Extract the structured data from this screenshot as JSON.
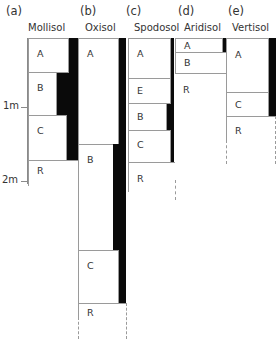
{
  "columns": [
    {
      "letter": "(a)",
      "name": "Mollisol",
      "horizons": [
        {
          "label": "A"
        },
        {
          "label": "B"
        },
        {
          "label": "C"
        },
        {
          "label": "R"
        }
      ]
    },
    {
      "letter": "(b)",
      "name": "Oxisol",
      "horizons": [
        {
          "label": "A"
        },
        {
          "label": "B"
        },
        {
          "label": "C"
        },
        {
          "label": "R"
        }
      ]
    },
    {
      "letter": "(c)",
      "name": "Spodosol",
      "horizons": [
        {
          "label": "A"
        },
        {
          "label": "E"
        },
        {
          "label": "B"
        },
        {
          "label": "C"
        },
        {
          "label": "R"
        }
      ]
    },
    {
      "letter": "(d)",
      "name": "Aridisol",
      "horizons": [
        {
          "label": "A"
        },
        {
          "label": "B"
        },
        {
          "label": "R"
        }
      ]
    },
    {
      "letter": "(e)",
      "name": "Vertisol",
      "horizons": [
        {
          "label": "A"
        },
        {
          "label": "C"
        },
        {
          "label": "R"
        }
      ]
    }
  ],
  "depth_axis": {
    "ticks": [
      {
        "label": "1m"
      },
      {
        "label": "2m"
      }
    ]
  },
  "colors": {
    "organic_bar": "#0a0a0a",
    "outline": "#9a9a9a"
  }
}
